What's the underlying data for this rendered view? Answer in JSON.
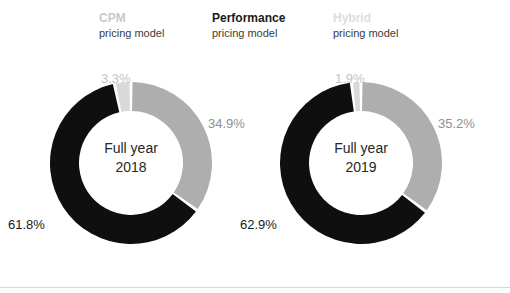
{
  "legend": {
    "items": [
      {
        "name": "cpm",
        "title": "CPM",
        "subtitle": "pricing model",
        "color": "#c9c9c9"
      },
      {
        "name": "performance",
        "title": "Performance",
        "subtitle": "pricing model",
        "color": "#1a1a1a"
      },
      {
        "name": "hybrid",
        "title": "Hybrid",
        "subtitle": "pricing model",
        "color": "#dddddd"
      }
    ]
  },
  "colors": {
    "performance": "#0f0f0f",
    "cpm": "#aeaeae",
    "hybrid": "#d9d9d9",
    "gap": "#ffffff",
    "background": "#ffffff",
    "rule": "#d8d8d8"
  },
  "charts": [
    {
      "name": "full-year-2018",
      "center_line1": "Full year",
      "center_line2": "2018",
      "labels": {
        "top": "3.3%",
        "right": "34.9%",
        "left": "61.8%"
      }
    },
    {
      "name": "full-year-2019",
      "center_line1": "Full year",
      "center_line2": "2019",
      "labels": {
        "top": "1.9%",
        "right": "35.2%",
        "left": "62.9%"
      }
    }
  ],
  "chart_data": [
    {
      "type": "pie",
      "title": "Full year 2018",
      "subtype": "donut",
      "categories": [
        "CPM pricing model",
        "Performance pricing model",
        "Hybrid pricing model"
      ],
      "values": [
        34.9,
        61.8,
        3.3
      ],
      "labels": [
        "34.9%",
        "61.8%",
        "3.3%"
      ],
      "colors": [
        "#aeaeae",
        "#0f0f0f",
        "#d9d9d9"
      ],
      "unit": "percent",
      "start_angle_deg": 0,
      "direction": "clockwise",
      "legend": [
        "CPM pricing model",
        "Performance pricing model",
        "Hybrid pricing model"
      ],
      "legend_position": "top"
    },
    {
      "type": "pie",
      "title": "Full year 2019",
      "subtype": "donut",
      "categories": [
        "CPM pricing model",
        "Performance pricing model",
        "Hybrid pricing model"
      ],
      "values": [
        35.2,
        62.9,
        1.9
      ],
      "labels": [
        "35.2%",
        "62.9%",
        "1.9%"
      ],
      "colors": [
        "#aeaeae",
        "#0f0f0f",
        "#d9d9d9"
      ],
      "unit": "percent",
      "start_angle_deg": 0,
      "direction": "clockwise",
      "legend": [
        "CPM pricing model",
        "Performance pricing model",
        "Hybrid pricing model"
      ],
      "legend_position": "top"
    }
  ]
}
